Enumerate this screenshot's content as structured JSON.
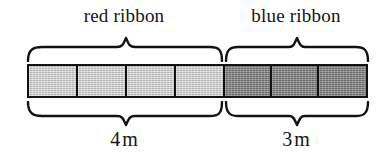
{
  "figure": {
    "type": "ribbon-length-diagram",
    "background_color": "#ffffff",
    "line_color": "#121212"
  },
  "top_labels": [
    {
      "text": "red ribbon",
      "center_x": 124
    },
    {
      "text": "blue ribbon",
      "center_x": 296
    }
  ],
  "bottom_labels": [
    {
      "value": "4",
      "unit": "m",
      "center_x": 124
    },
    {
      "value": "3",
      "unit": "m",
      "center_x": 296
    }
  ],
  "bar": {
    "left": 27,
    "top": 64,
    "width": 341,
    "height": 34,
    "total_cells": 7,
    "divider_x": 223,
    "segments": [
      {
        "name": "red ribbon",
        "cells": 4,
        "length_value": "4",
        "length_unit": "m",
        "fill_color": "#c9c9c9",
        "shade": "light",
        "span": {
          "start_x": 27,
          "end_x": 223
        }
      },
      {
        "name": "blue ribbon",
        "cells": 3,
        "length_value": "3",
        "length_unit": "m",
        "fill_color": "#848484",
        "shade": "dark",
        "span": {
          "start_x": 223,
          "end_x": 368
        }
      }
    ]
  },
  "braces": {
    "top": [
      {
        "label": "red ribbon",
        "start_x": 27,
        "end_x": 221,
        "peak_x": 124,
        "direction": "down"
      },
      {
        "label": "blue ribbon",
        "start_x": 225,
        "end_x": 368,
        "peak_x": 296,
        "direction": "down"
      }
    ],
    "bottom": [
      {
        "label": "4 m",
        "start_x": 27,
        "end_x": 221,
        "peak_x": 124,
        "direction": "up"
      },
      {
        "label": "3 m",
        "start_x": 225,
        "end_x": 368,
        "peak_x": 296,
        "direction": "up"
      }
    ]
  }
}
